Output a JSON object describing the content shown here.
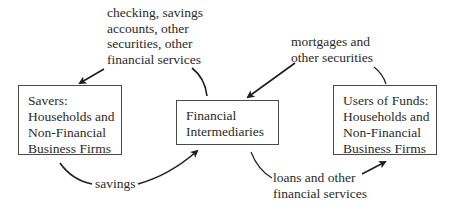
{
  "diagram": {
    "nodes": {
      "savers": {
        "lines": [
          "Savers:",
          "Households and",
          "Non-Financial",
          "Business Firms"
        ]
      },
      "intermediaries": {
        "lines": [
          "Financial",
          "Intermediaries"
        ]
      },
      "users": {
        "lines": [
          "Users of Funds:",
          "Households and",
          "Non-Financial",
          "Business Firms"
        ]
      }
    },
    "edges": {
      "services_to_savers": {
        "lines": [
          "checking, savings",
          "accounts, other",
          "securities, other",
          "financial services"
        ]
      },
      "securities_to_intermediaries": {
        "lines": [
          "mortgages and",
          "other securities"
        ]
      },
      "savings_to_intermediaries": {
        "lines": [
          "savings"
        ]
      },
      "loans_to_users": {
        "lines": [
          "loans and other",
          "financial services"
        ]
      }
    },
    "colors": {
      "line": "#1e1e1e",
      "text": "#2a2a2a",
      "border": "#4a4a4a"
    }
  }
}
